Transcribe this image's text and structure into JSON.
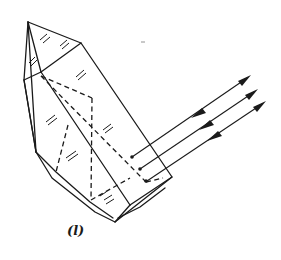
{
  "figure": {
    "caption": "(l)",
    "ray_count": 3,
    "colors": {
      "line": "#1a1a1a",
      "background": "#ffffff"
    }
  }
}
